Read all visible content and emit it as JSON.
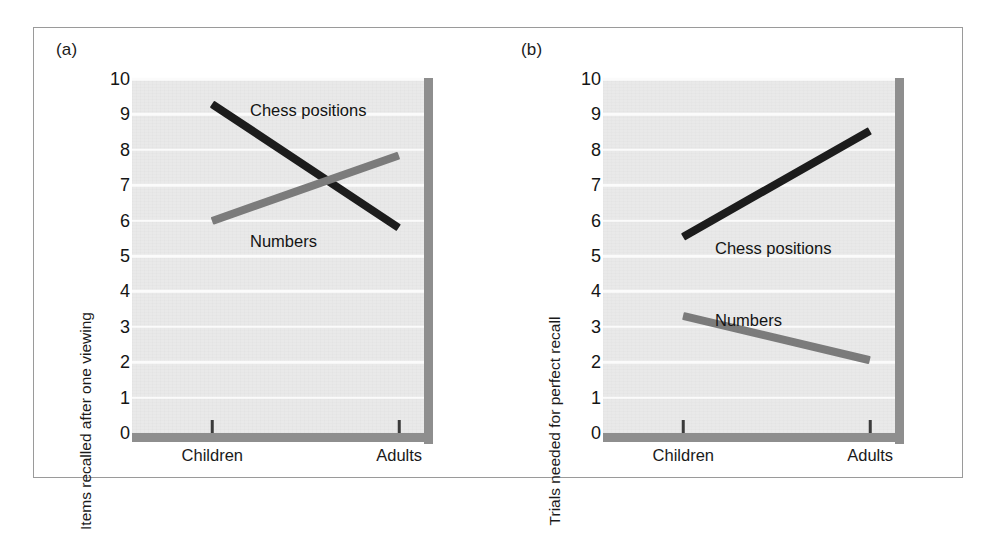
{
  "figure": {
    "panels": [
      {
        "tag": "(a)",
        "ylabel": "Items recalled after one viewing",
        "yticks": [
          "10",
          "9",
          "8",
          "7",
          "6",
          "5",
          "4",
          "3",
          "2",
          "1",
          "0"
        ],
        "xticks": [
          "Children",
          "Adults"
        ],
        "series": [
          {
            "name": "Chess positions",
            "label": "Chess positions",
            "color": "#1c1c1c",
            "label_x": 118,
            "label_y": 22
          },
          {
            "name": "Numbers",
            "label": "Numbers",
            "color": "#7b7b7b",
            "label_x": 118,
            "label_y": 153
          }
        ]
      },
      {
        "tag": "(b)",
        "ylabel": "Trials needed for perfect recall",
        "yticks": [
          "10",
          "9",
          "8",
          "7",
          "6",
          "5",
          "4",
          "3",
          "2",
          "1",
          "0"
        ],
        "xticks": [
          "Children",
          "Adults"
        ],
        "series": [
          {
            "name": "Chess positions",
            "label": "Chess positions",
            "color": "#1c1c1c",
            "label_x": 112,
            "label_y": 160
          },
          {
            "name": "Numbers",
            "label": "Numbers",
            "color": "#7b7b7b",
            "label_x": 112,
            "label_y": 232
          }
        ]
      }
    ]
  },
  "chart_data": [
    {
      "type": "line",
      "panel": "(a)",
      "title": "",
      "xlabel": "",
      "ylabel": "Items recalled after one viewing",
      "categories": [
        "Children",
        "Adults"
      ],
      "x": [
        0,
        1
      ],
      "ylim": [
        0,
        10
      ],
      "yticks": [
        0,
        1,
        2,
        3,
        4,
        5,
        6,
        7,
        8,
        9,
        10
      ],
      "grid": true,
      "legend": "inline-labels",
      "series": [
        {
          "name": "Chess positions",
          "values": [
            9.3,
            5.8
          ],
          "color": "#1c1c1c"
        },
        {
          "name": "Numbers",
          "values": [
            6.0,
            7.85
          ],
          "color": "#7b7b7b"
        }
      ]
    },
    {
      "type": "line",
      "panel": "(b)",
      "title": "",
      "xlabel": "",
      "ylabel": "Trials needed for perfect recall",
      "categories": [
        "Children",
        "Adults"
      ],
      "x": [
        0,
        1
      ],
      "ylim": [
        0,
        10
      ],
      "yticks": [
        0,
        1,
        2,
        3,
        4,
        5,
        6,
        7,
        8,
        9,
        10
      ],
      "grid": true,
      "legend": "inline-labels",
      "series": [
        {
          "name": "Chess positions",
          "values": [
            5.55,
            8.55
          ],
          "color": "#1c1c1c"
        },
        {
          "name": "Numbers",
          "values": [
            3.3,
            2.05
          ],
          "color": "#7b7b7b"
        }
      ]
    }
  ]
}
